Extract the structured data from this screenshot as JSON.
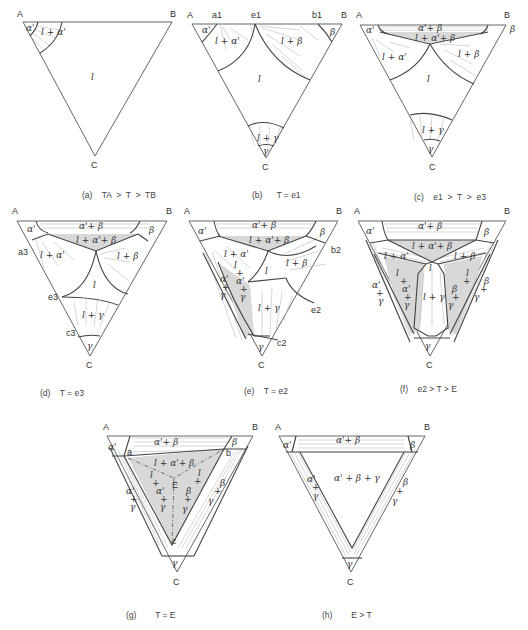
{
  "figure": {
    "panels": [
      {
        "id": "a",
        "caption": "(a)   TA > T > TB",
        "vertices": [
          "A",
          "B",
          "C"
        ],
        "regions": [
          "α'",
          "l + α'",
          "l"
        ],
        "points": []
      },
      {
        "id": "b",
        "caption": "(b)    T = e1",
        "vertices": [
          "A",
          "B",
          "C"
        ],
        "regions": [
          "α'",
          "l + α'",
          "l",
          "l + β",
          "β",
          "l + γ",
          "γ"
        ],
        "points": [
          "a1",
          "e1",
          "b1"
        ]
      },
      {
        "id": "c",
        "caption": "(c)   e1 > T > e3",
        "vertices": [
          "A",
          "B",
          "C"
        ],
        "regions": [
          "α'",
          "α'+β",
          "l+α'+β",
          "β",
          "l + α'",
          "l + β",
          "l",
          "l + γ",
          "γ"
        ],
        "points": []
      },
      {
        "id": "d",
        "caption": "(d)   T = e3",
        "vertices": [
          "A",
          "B",
          "C"
        ],
        "regions": [
          "α'",
          "α'+β",
          "l + α'+β",
          "β",
          "l + α'",
          "l + β",
          "l",
          "l + γ",
          "γ"
        ],
        "points": [
          "a3",
          "e3",
          "c3"
        ]
      },
      {
        "id": "e",
        "caption": "(e)   T = e2",
        "vertices": [
          "A",
          "B",
          "C"
        ],
        "regions": [
          "α'",
          "α'+β",
          "l + α'+β",
          "β",
          "l + α'",
          "l + β",
          "l",
          "α'+γ",
          "l+α'+γ",
          "l + γ",
          "γ"
        ],
        "points": [
          "b2",
          "e2",
          "c2"
        ]
      },
      {
        "id": "f",
        "caption": "(f)   e2 > T > E",
        "vertices": [
          "A",
          "B",
          "C"
        ],
        "regions": [
          "α'",
          "α'+β",
          "l + α' + β",
          "β",
          "l + α'",
          "l + β",
          "l",
          "α'+γ",
          "l+α'+γ",
          "l+γ",
          "l+β+γ",
          "β+γ",
          "γ"
        ],
        "points": []
      },
      {
        "id": "g",
        "caption": "(g)      T = E",
        "vertices": [
          "A",
          "B",
          "C"
        ],
        "regions": [
          "α'",
          "α'+β",
          "l + α'+β",
          "β",
          "α'+γ",
          "l+α'+γ",
          "l+β+γ",
          "β+γ",
          "γ"
        ],
        "points": [
          "a",
          "b",
          "c",
          "E"
        ]
      },
      {
        "id": "h",
        "caption": "(h)      E > T",
        "vertices": [
          "A",
          "B",
          "C"
        ],
        "regions": [
          "α'",
          "α'+β",
          "β",
          "α'+γ",
          "α' + β + γ",
          "β+γ",
          "γ"
        ],
        "points": []
      }
    ]
  },
  "labels": {
    "A": "A",
    "B": "B",
    "C": "C",
    "alpha": "α'",
    "beta": "β",
    "gamma": "γ",
    "l": "l",
    "l_alpha": "l + α'",
    "l_beta": "l + β",
    "l_gamma": "l + γ",
    "alpha_beta": "α'+ β",
    "l_alpha_beta": "l + α'+ β",
    "alpha_beta_gamma": "α' + β + γ",
    "a1": "a1",
    "e1": "e1",
    "b1": "b1",
    "a3": "a3",
    "e3": "e3",
    "c3": "c3",
    "b2": "b2",
    "e2": "e2",
    "c2": "c2",
    "a": "a",
    "b": "b",
    "c": "c",
    "E": "E",
    "plus": "+"
  },
  "captions": {
    "a": "(a)    TA  >  T  >  TB",
    "b": "(b)      T = e1",
    "c": "(c)    e1  >  T  >  e3",
    "d": "(d)    T = e3",
    "e": "(e)    T = e2",
    "f": "(f)    e2 > T > E",
    "g": "(g)        T = E",
    "h": "(h)        E > T"
  }
}
